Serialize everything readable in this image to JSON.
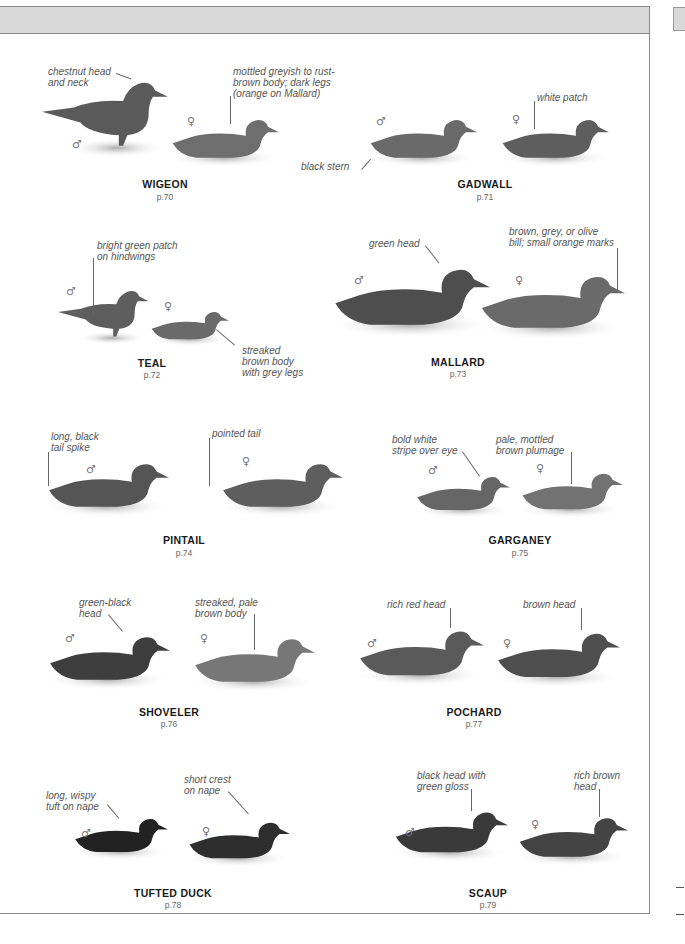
{
  "page": {
    "header_band_color": "#d9d9d9",
    "border_color": "#8a8a8a"
  },
  "symbols": {
    "male": "♂",
    "female": "♀"
  },
  "species": [
    {
      "name": "WIGEON",
      "page_ref": "p.70",
      "notes": [
        "chestnut head\nand neck",
        "mottled greyish to rust-\nbrown body; dark legs\n(orange on Mallard)"
      ]
    },
    {
      "name": "GADWALL",
      "page_ref": "p.71",
      "notes": [
        "black stern",
        "white patch"
      ]
    },
    {
      "name": "TEAL",
      "page_ref": "p.72",
      "notes": [
        "bright green patch\non hindwings",
        "streaked\nbrown body\nwith grey legs"
      ]
    },
    {
      "name": "MALLARD",
      "page_ref": "p.73",
      "notes": [
        "green head",
        "brown, grey, or olive\nbill; small orange marks"
      ]
    },
    {
      "name": "PINTAIL",
      "page_ref": "p.74",
      "notes": [
        "long, black\ntail spike",
        "pointed tail"
      ]
    },
    {
      "name": "GARGANEY",
      "page_ref": "p.75",
      "notes": [
        "bold white\nstripe over eye",
        "pale, mottled\nbrown plumage"
      ]
    },
    {
      "name": "SHOVELER",
      "page_ref": "p.76",
      "notes": [
        "green-black\nhead",
        "streaked, pale\nbrown body"
      ]
    },
    {
      "name": "POCHARD",
      "page_ref": "p.77",
      "notes": [
        "rich red head",
        "brown head"
      ]
    },
    {
      "name": "TUFTED DUCK",
      "page_ref": "p.78",
      "notes": [
        "long, wispy\ntuft on nape",
        "short crest\non nape"
      ]
    },
    {
      "name": "SCAUP",
      "page_ref": "p.79",
      "notes": [
        "black head with\ngreen gloss",
        "rich brown\nhead"
      ]
    }
  ]
}
